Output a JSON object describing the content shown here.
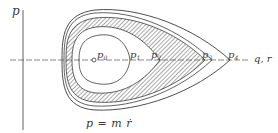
{
  "diagram": {
    "type": "phase-space diagram",
    "axes": {
      "vertical_label": "p",
      "horizontal_label": "q, r"
    },
    "points": [
      {
        "id": "p0",
        "label": "p",
        "sub": "0"
      },
      {
        "id": "p1",
        "label": "p",
        "sub": "1"
      },
      {
        "id": "p2",
        "label": "p",
        "sub": "2"
      },
      {
        "id": "p3",
        "label": "p",
        "sub": "3"
      },
      {
        "id": "p4",
        "label": "p",
        "sub": "4"
      }
    ],
    "caption": "p = m ṙ",
    "caption_dot_char": "˙",
    "colors": {
      "line": "#3a3a3a",
      "hatch": "#555555",
      "background": "#ffffff"
    }
  }
}
